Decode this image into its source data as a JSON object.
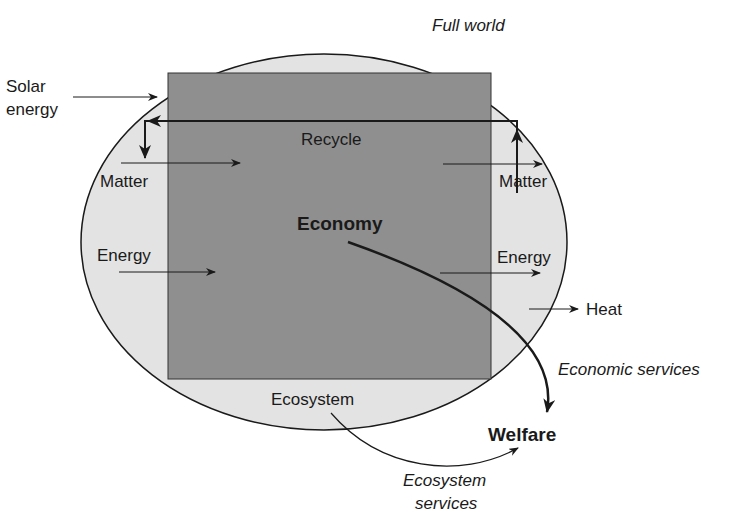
{
  "diagram": {
    "title": "Full world",
    "regions": {
      "outer": "Ecosystem",
      "inner": "Economy"
    },
    "labels": {
      "full_world": "Full world",
      "solar_line1": "Solar",
      "solar_line2": "energy",
      "recycle": "Recycle",
      "matter_in": "Matter",
      "matter_out": "Matter",
      "economy": "Economy",
      "energy_in": "Energy",
      "energy_out": "Energy",
      "heat": "Heat",
      "economic_services": "Economic services",
      "ecosystem": "Ecosystem",
      "welfare": "Welfare",
      "ecosystem_services_line1": "Ecosystem",
      "ecosystem_services_line2": "services"
    },
    "colors": {
      "ellipse_fill": "#e3e3e3",
      "economy_fill": "#8f8f8f",
      "line": "#1a1a1a"
    }
  }
}
